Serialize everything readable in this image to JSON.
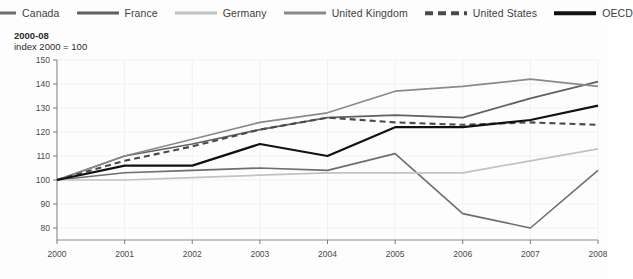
{
  "legend": {
    "items": [
      {
        "label": "Canada",
        "color": "#6e6e6e",
        "style": "solid",
        "name": "legend-item-canada"
      },
      {
        "label": "France",
        "color": "#616161",
        "style": "solid",
        "name": "legend-item-france"
      },
      {
        "label": "Germany",
        "color": "#c2c2c2",
        "style": "solid",
        "name": "legend-item-germany"
      },
      {
        "label": "United Kingdom",
        "color": "#8a8a8a",
        "style": "solid",
        "name": "legend-item-united-kingdom"
      },
      {
        "label": "United States",
        "color": "#4a4a4a",
        "style": "dashed",
        "name": "legend-item-united-states"
      },
      {
        "label": "OECD",
        "color": "#111111",
        "style": "solid",
        "name": "legend-item-oecd"
      }
    ]
  },
  "title": {
    "period": "2000-08",
    "subtitle": "index 2000 = 100"
  },
  "chart_data": {
    "type": "line",
    "title": "2000-08",
    "subtitle": "index 2000 = 100",
    "xlabel": "",
    "ylabel": "",
    "x": [
      2000,
      2001,
      2002,
      2003,
      2004,
      2005,
      2006,
      2007,
      2008
    ],
    "xtick_labels": [
      "2000",
      "2001",
      "2002",
      "2003",
      "2004",
      "2005",
      "2006",
      "2007",
      "2008"
    ],
    "ytick_labels": [
      "80",
      "90",
      "100",
      "110",
      "120",
      "130",
      "140",
      "150"
    ],
    "ylim": [
      75,
      150
    ],
    "yticks": [
      80,
      90,
      100,
      110,
      120,
      130,
      140,
      150
    ],
    "grid": true,
    "legend_position": "top",
    "series": [
      {
        "name": "Canada",
        "color": "#6e6e6e",
        "style": "solid",
        "width": 1.6,
        "values": [
          100,
          103,
          104,
          105,
          104,
          111,
          86,
          80,
          104
        ]
      },
      {
        "name": "France",
        "color": "#616161",
        "style": "solid",
        "width": 1.7,
        "values": [
          100,
          110,
          115,
          121,
          126,
          127,
          126,
          134,
          141
        ]
      },
      {
        "name": "Germany",
        "color": "#c2c2c2",
        "style": "solid",
        "width": 1.7,
        "values": [
          100,
          100,
          101,
          102,
          103,
          103,
          103,
          108,
          113
        ]
      },
      {
        "name": "United Kingdom",
        "color": "#8a8a8a",
        "style": "solid",
        "width": 1.7,
        "values": [
          100,
          110,
          117,
          124,
          128,
          137,
          139,
          142,
          139
        ]
      },
      {
        "name": "United States",
        "color": "#4a4a4a",
        "style": "dashed",
        "width": 2.1,
        "dash": "6,4",
        "values": [
          100,
          108,
          114,
          121,
          126,
          124,
          123,
          124,
          123
        ]
      },
      {
        "name": "OECD",
        "color": "#111111",
        "style": "solid",
        "width": 2.2,
        "values": [
          100,
          106,
          106,
          115,
          110,
          122,
          122,
          125,
          131
        ]
      }
    ]
  }
}
